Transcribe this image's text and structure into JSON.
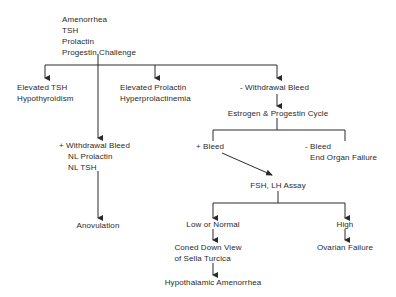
{
  "diagram": {
    "type": "flowchart",
    "root": {
      "lines": [
        "Amenorrhea",
        "TSH",
        "Prolactin",
        "Progestin Challenge"
      ]
    },
    "level1": {
      "elevated_tsh": [
        "Elevated TSH",
        "Hypothyroidism"
      ],
      "elevated_prolactin": [
        "Elevated Prolactin",
        "Hyperprolactinemia"
      ],
      "neg_withdrawal": "- Withdrawal Bleed",
      "pos_withdrawal": [
        "+ Withdrawal Bleed",
        "NL Prolactin",
        "NL TSH"
      ]
    },
    "anovulation": "Anovulation",
    "estrogen_cycle": "Estrogen & Progestin Cycle",
    "pos_bleed": "+ Bleed",
    "neg_bleed": [
      "- Bleed",
      "End Organ Failure"
    ],
    "assay": "FSH, LH Assay",
    "low_normal": "Low or Normal",
    "high": "High",
    "coned_view": [
      "Coned Down View",
      "of Sella Turcica"
    ],
    "ovarian_failure": "Ovarian Failure",
    "hypothalamic": "Hypothalamic Amenorrhea",
    "line_color": "#2a2a2a"
  }
}
